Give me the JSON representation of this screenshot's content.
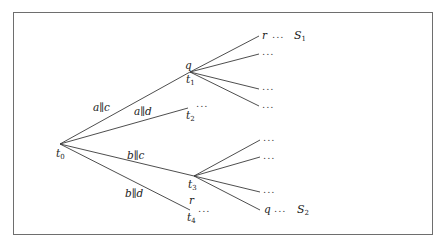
{
  "diagram": {
    "type": "execution-tree",
    "root": {
      "name": "t",
      "sub": "0"
    },
    "nodes": [
      {
        "id": "t1",
        "name": "t",
        "sub": "1",
        "top_label": "q"
      },
      {
        "id": "t2",
        "name": "t",
        "sub": "2",
        "continuation": "..."
      },
      {
        "id": "t3",
        "name": "t",
        "sub": "3"
      },
      {
        "id": "t4",
        "name": "t",
        "sub": "4",
        "top_label": "r",
        "continuation": "..."
      }
    ],
    "edges": [
      {
        "from": "t0",
        "to": "t1",
        "label": "a∥c"
      },
      {
        "from": "t0",
        "to": "t2",
        "label": "a∥d"
      },
      {
        "from": "t0",
        "to": "t3",
        "label": "b∥c"
      },
      {
        "from": "t0",
        "to": "t4",
        "label": "b∥d"
      }
    ],
    "t1_leaves": [
      {
        "state": "r",
        "dots": "...",
        "set": {
          "name": "S",
          "sub": "1"
        }
      },
      {
        "state": "",
        "dots": "..."
      },
      {
        "state": "",
        "dots": "..."
      },
      {
        "state": "",
        "dots": "..."
      }
    ],
    "t3_leaves": [
      {
        "state": "",
        "dots": "..."
      },
      {
        "state": "",
        "dots": "..."
      },
      {
        "state": "",
        "dots": "..."
      },
      {
        "state": "q",
        "dots": "...",
        "set": {
          "name": "S",
          "sub": "2"
        }
      }
    ]
  }
}
